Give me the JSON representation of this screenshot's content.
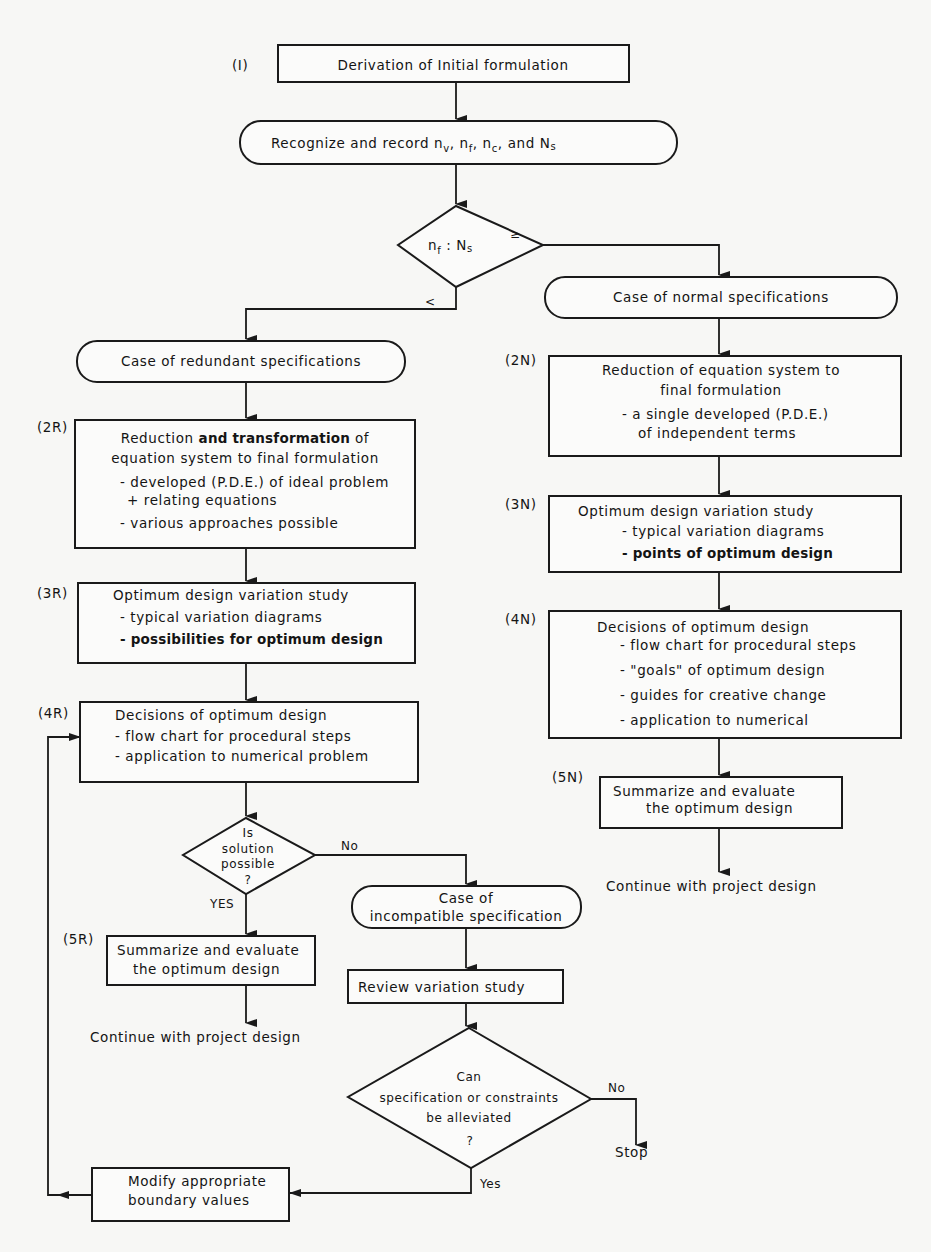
{
  "colors": {
    "background": "#f7f7f5",
    "ink": "#1a1a1a"
  },
  "nodes": {
    "n1": {
      "step": "(I)",
      "text": "Derivation of Initial formulation"
    },
    "record": {
      "prefix": "Recognize and record ",
      "v1": "n",
      "v1s": "v",
      "v2": "n",
      "v2s": "f",
      "v3": "n",
      "v3s": "c",
      "and": ", and ",
      "v4": "N",
      "v4s": "s"
    },
    "d1": {
      "a": "n",
      "as": "f",
      "colon": " : ",
      "b": "N",
      "bs": "s",
      "branch_ge": "≥",
      "branch_lt": "<"
    },
    "redundant": {
      "text": "Case   of  redundant specifications"
    },
    "normal": {
      "text": "Case  of  normal specifications"
    },
    "r2": {
      "step": "(2R)",
      "l1a": "Reduction ",
      "l1b": "and transformation",
      "l1c": " of",
      "l2": "equation system to final formulation",
      "l3": "- developed (P.D.E.) of  ideal problem",
      "l4": "+ relating  equations",
      "l5": "- various  approaches  possible"
    },
    "r3": {
      "step": "(3R)",
      "l1": "Optimum  design variation study",
      "l2": "- typical  variation diagrams",
      "l3": "- possibilities for optimum design"
    },
    "r4": {
      "step": "(4R)",
      "l1": "Decisions  of  optimum design",
      "l2": "- flow chart for procedural steps",
      "l3": "- application to numerical problem"
    },
    "d2": {
      "l1": "Is",
      "l2": "solution",
      "l3": "possible",
      "l4": "?",
      "yes": "YES",
      "no": "No"
    },
    "r5": {
      "step": "(5R)",
      "l1": "Summarize and evaluate",
      "l2": "the optimum design"
    },
    "r_continue": {
      "text": "Continue  with  project  design"
    },
    "incompat": {
      "l1": "Case  of",
      "l2": "incompatible specification"
    },
    "review": {
      "text": "Review  variation  study"
    },
    "d3": {
      "l1": "Can",
      "l2": "specification or  constraints",
      "l3": "be  alleviated",
      "l4": "?",
      "yes": "Yes",
      "no": "No"
    },
    "stop": {
      "text": "Stop"
    },
    "modify": {
      "l1": "Modify appropriate",
      "l2": "boundary values"
    },
    "n2": {
      "step": "(2N)",
      "l1": "Reduction  of  equation  system to",
      "l2": "final formulation",
      "l3": "- a  single developed (P.D.E.)",
      "l4": "of  independent  terms"
    },
    "n3": {
      "step": "(3N)",
      "l1": "Optimum  design  variation  study",
      "l2": "- typical variation diagrams",
      "l3": "- points of optimum design"
    },
    "n4": {
      "step": "(4N)",
      "l1": "Decisions  of  optimum  design",
      "l2": "- flow chart for procedural  steps",
      "l3": "- \"goals\" of  optimum  design",
      "l4": "- guides  for  creative  change",
      "l5": "- application  to  numerical"
    },
    "n5": {
      "step": "(5N)",
      "l1": "Summarize and evaluate",
      "l2": "the  optimum design"
    },
    "n_continue": {
      "text": "Continue  with  project design"
    }
  }
}
